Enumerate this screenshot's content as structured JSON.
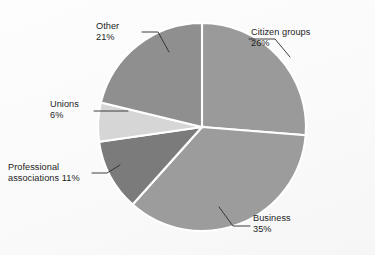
{
  "chart_data": {
    "type": "pie",
    "title": "",
    "subtitle": "",
    "xlabel": "",
    "ylabel": "",
    "legend_position": "none",
    "grid": false,
    "units": "percent",
    "start_angle_deg": 0,
    "direction": "clockwise",
    "categories": [
      "Citizen groups",
      "Business",
      "Professional associations",
      "Unions",
      "Other"
    ],
    "values": [
      26,
      35,
      11,
      6,
      21
    ],
    "slices": [
      {
        "name": "Citizen groups",
        "label": "Citizen groups",
        "percent_text": "26%",
        "value": 26,
        "color": "#9a9a9a",
        "start_deg": 0,
        "end_deg": 93.6
      },
      {
        "name": "Business",
        "label": "Business",
        "percent_text": "35%",
        "value": 35,
        "color": "#9c9c9c",
        "start_deg": 93.6,
        "end_deg": 219.6
      },
      {
        "name": "Professional associations",
        "label": "Professional",
        "label_line2": "associations 11%",
        "percent_text": "11%",
        "value": 11,
        "color": "#7b7b7b",
        "start_deg": 219.6,
        "end_deg": 259.2
      },
      {
        "name": "Unions",
        "label": "Unions",
        "percent_text": "6%",
        "value": 6,
        "color": "#d6d6d6",
        "start_deg": 259.2,
        "end_deg": 280.8
      },
      {
        "name": "Other",
        "label": "Other",
        "percent_text": "21%",
        "value": 21,
        "color": "#8f8f8f",
        "start_deg": 280.8,
        "end_deg": 360
      }
    ]
  },
  "colors": {
    "background": "#fafafa",
    "slice_separator": "#ffffff",
    "leader_line": "#2a2a2a",
    "label_text": "#1d1d1d"
  },
  "labels": {
    "citizen_groups": {
      "name": "Citizen groups",
      "percent": "26%"
    },
    "business": {
      "name": "Business",
      "percent": "35%"
    },
    "professional_associations": {
      "line1": "Professional",
      "line2": "associations 11%"
    },
    "unions": {
      "name": "Unions",
      "percent": "6%"
    },
    "other": {
      "name": "Other",
      "percent": "21%"
    }
  }
}
